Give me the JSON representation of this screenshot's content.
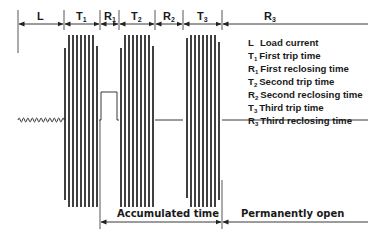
{
  "diagram": {
    "type": "recloser-timing-diagram",
    "top_segments": [
      {
        "label": "L",
        "sub": ""
      },
      {
        "label": "T",
        "sub": "1"
      },
      {
        "label": "R",
        "sub": "1"
      },
      {
        "label": "T",
        "sub": "2"
      },
      {
        "label": "R",
        "sub": "2"
      },
      {
        "label": "T",
        "sub": "3"
      },
      {
        "label": "R",
        "sub": "3"
      }
    ],
    "legend": [
      {
        "sym": "L",
        "sub": "",
        "text": "Load current"
      },
      {
        "sym": "T",
        "sub": "1",
        "text": "First trip time"
      },
      {
        "sym": "R",
        "sub": "1",
        "text": "First reclosing time"
      },
      {
        "sym": "T",
        "sub": "2",
        "text": "Second trip time"
      },
      {
        "sym": "R",
        "sub": "2",
        "text": "Second reclosing time"
      },
      {
        "sym": "T",
        "sub": "3",
        "text": "Third trip time"
      },
      {
        "sym": "R",
        "sub": "3",
        "text": "Third reclosing time"
      }
    ],
    "bottom_spans": [
      {
        "label": "Accumulated time"
      },
      {
        "label": "Permanently open"
      }
    ],
    "colors": {
      "line": "#222222",
      "text": "#1a1a1a",
      "background": "#ffffff"
    }
  }
}
